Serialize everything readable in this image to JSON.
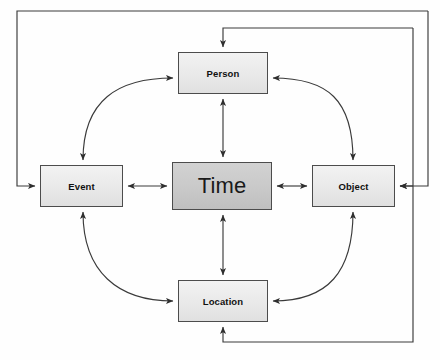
{
  "diagram": {
    "type": "node-link-diagram",
    "canvas": {
      "width": 440,
      "height": 360,
      "background": "#fefefe"
    },
    "style": {
      "node_fill_satellite": "#ececec",
      "node_fill_center": "#c9c9c9",
      "node_border": "#4c4c4c",
      "edge_color": "#3a3a3a",
      "label_color": "#111111"
    },
    "nodes": [
      {
        "id": "person",
        "label": "Person",
        "role": "satellite",
        "position": "top",
        "x": 178,
        "y": 52,
        "w": 90,
        "h": 42
      },
      {
        "id": "event",
        "label": "Event",
        "role": "satellite",
        "position": "left",
        "x": 40,
        "y": 165,
        "w": 83,
        "h": 42
      },
      {
        "id": "time",
        "label": "Time",
        "role": "center",
        "position": "center",
        "x": 172,
        "y": 162,
        "w": 100,
        "h": 48
      },
      {
        "id": "object",
        "label": "Object",
        "role": "satellite",
        "position": "right",
        "x": 312,
        "y": 165,
        "w": 83,
        "h": 42
      },
      {
        "id": "location",
        "label": "Location",
        "role": "satellite",
        "position": "bottom",
        "x": 178,
        "y": 280,
        "w": 90,
        "h": 42
      }
    ],
    "edges": [
      {
        "from": "person",
        "to": "time",
        "shape": "straight",
        "arrows": "both"
      },
      {
        "from": "event",
        "to": "time",
        "shape": "straight",
        "arrows": "both"
      },
      {
        "from": "time",
        "to": "object",
        "shape": "straight",
        "arrows": "both"
      },
      {
        "from": "time",
        "to": "location",
        "shape": "straight",
        "arrows": "both"
      },
      {
        "from": "event",
        "to": "person",
        "shape": "curved",
        "arrows": "both"
      },
      {
        "from": "person",
        "to": "object",
        "shape": "curved",
        "arrows": "both"
      },
      {
        "from": "event",
        "to": "location",
        "shape": "curved",
        "arrows": "both"
      },
      {
        "from": "location",
        "to": "object",
        "shape": "curved",
        "arrows": "both"
      },
      {
        "from": "object",
        "to": "event",
        "shape": "orthogonal-outer",
        "arrows": "single",
        "route": "around-top-left"
      },
      {
        "from": "person",
        "to": "object",
        "shape": "orthogonal-outer",
        "arrows": "single",
        "route": "around-top-right"
      },
      {
        "from": "object",
        "to": "location",
        "shape": "orthogonal-outer",
        "arrows": "single",
        "route": "around-bottom-right"
      }
    ]
  }
}
